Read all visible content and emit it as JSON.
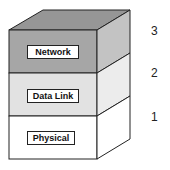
{
  "diagram": {
    "layers": [
      {
        "number": "3",
        "label": "Network",
        "front_color": "#a6a6a6",
        "side_color": "#c3c3c3",
        "top_color": "#969696"
      },
      {
        "number": "2",
        "label": "Data Link",
        "front_color": "#e2e2e2",
        "side_color": "#ececec"
      },
      {
        "number": "1",
        "label": "Physical",
        "front_color": "#ffffff",
        "side_color": "#ffffff"
      }
    ]
  }
}
